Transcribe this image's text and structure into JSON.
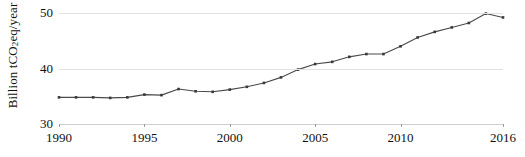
{
  "chart_data": {
    "type": "line",
    "title": "",
    "xlabel": "",
    "ylabel": "Billion tCO2eq/year",
    "ylabel_rich": {
      "prefix": "Billion tCO",
      "subscript": "2",
      "suffix": "eq/year"
    },
    "x": [
      1990,
      1991,
      1992,
      1993,
      1994,
      1995,
      1996,
      1997,
      1998,
      1999,
      2000,
      2001,
      2002,
      2003,
      2004,
      2005,
      2006,
      2007,
      2008,
      2009,
      2010,
      2011,
      2012,
      2013,
      2014,
      2015,
      2016
    ],
    "values": [
      34.8,
      34.8,
      34.8,
      34.7,
      34.8,
      35.3,
      35.2,
      36.3,
      35.9,
      35.8,
      36.2,
      36.7,
      37.4,
      38.4,
      39.8,
      40.8,
      41.2,
      42.1,
      42.6,
      42.6,
      44.0,
      45.6,
      46.6,
      47.4,
      48.2,
      49.9,
      49.2
    ],
    "series": [
      {
        "name": "Global greenhouse gas emissions",
        "values": [
          34.8,
          34.8,
          34.8,
          34.7,
          34.8,
          35.3,
          35.2,
          36.3,
          35.9,
          35.8,
          36.2,
          36.7,
          37.4,
          38.4,
          39.8,
          40.8,
          41.2,
          42.1,
          42.6,
          42.6,
          44.0,
          45.6,
          46.6,
          47.4,
          48.2,
          49.9,
          49.2
        ]
      }
    ],
    "xlim": [
      1990,
      2016
    ],
    "ylim": [
      30,
      50
    ],
    "yticks": [
      30,
      40,
      50
    ],
    "ytick_labels": [
      "30",
      "40",
      "50"
    ],
    "xticks": [
      1990,
      1995,
      2000,
      2005,
      2010,
      2016
    ],
    "xtick_labels": [
      "1990",
      "1995",
      "2000",
      "2005",
      "2010",
      "2016"
    ],
    "grid": true,
    "grid_axis": "y",
    "legend": false,
    "legend_position": "none",
    "marker": "square",
    "line_color": "#4a4a4a",
    "marker_color": "#3a3a3a",
    "grid_color": "#e2e2e2",
    "background_color": "#ffffff"
  }
}
